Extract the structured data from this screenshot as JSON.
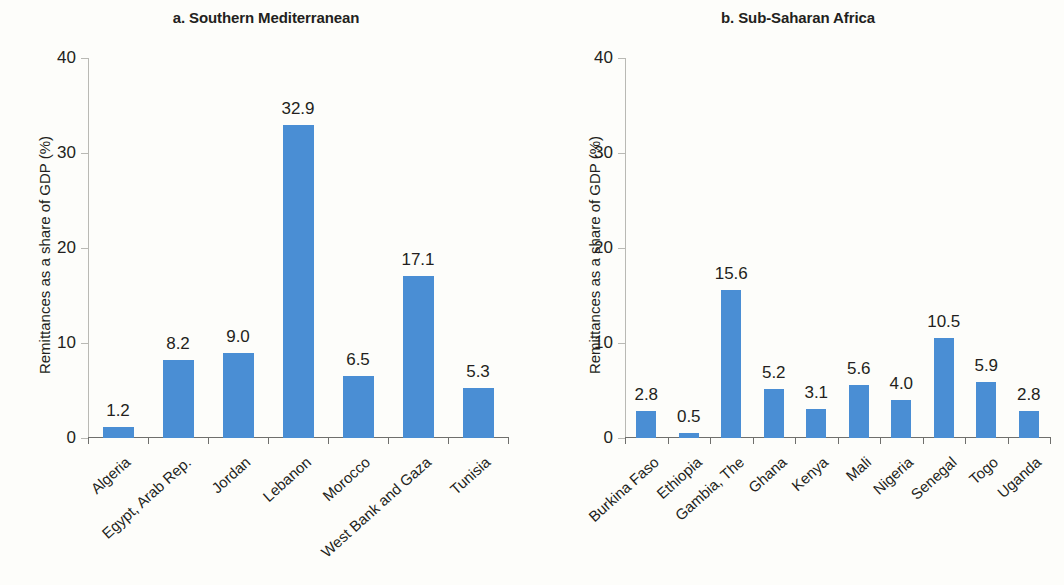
{
  "figure": {
    "background": "#fdfdfa",
    "bar_color": "#4a8ed4",
    "axis_color": "#6f6f6c"
  },
  "chart_data": [
    {
      "type": "bar",
      "panel_id": "a",
      "title": "a. Southern Mediterranean",
      "xlabel": "",
      "ylabel": "Remittances as a share of GDP (%)",
      "ylim": [
        0,
        40
      ],
      "yticks": [
        0,
        10,
        20,
        30,
        40
      ],
      "ytick_labels": [
        "0",
        "10",
        "20",
        "30",
        "40"
      ],
      "grid": false,
      "legend": null,
      "categories": [
        "Algeria",
        "Egypt, Arab Rep.",
        "Jordan",
        "Lebanon",
        "Morocco",
        "West Bank and Gaza",
        "Tunisia"
      ],
      "values": [
        1.2,
        8.2,
        9.0,
        32.9,
        6.5,
        17.1,
        5.3
      ],
      "value_labels": [
        "1.2",
        "8.2",
        "9.0",
        "32.9",
        "6.5",
        "17.1",
        "5.3"
      ]
    },
    {
      "type": "bar",
      "panel_id": "b",
      "title": "b. Sub-Saharan Africa",
      "xlabel": "",
      "ylabel": "Remittances as a share of GDP (%)",
      "ylim": [
        0,
        40
      ],
      "yticks": [
        0,
        10,
        20,
        30,
        40
      ],
      "ytick_labels": [
        "0",
        "10",
        "20",
        "30",
        "40"
      ],
      "grid": false,
      "legend": null,
      "categories": [
        "Burkina Faso",
        "Ethiopia",
        "Gambia, The",
        "Ghana",
        "Kenya",
        "Mali",
        "Nigeria",
        "Senegal",
        "Togo",
        "Uganda"
      ],
      "values": [
        2.8,
        0.5,
        15.6,
        5.2,
        3.1,
        5.6,
        4.0,
        10.5,
        5.9,
        2.8
      ],
      "value_labels": [
        "2.8",
        "0.5",
        "15.6",
        "5.2",
        "3.1",
        "5.6",
        "4.0",
        "10.5",
        "5.9",
        "2.8"
      ]
    }
  ]
}
